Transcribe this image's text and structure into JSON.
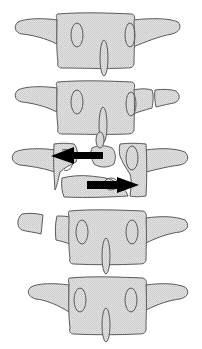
{
  "diagram": {
    "colors": {
      "bone_fill": "#d9d9d9",
      "outline": "#5a5a5a",
      "arrow": "#000000",
      "background": "#ffffff"
    },
    "vertebrae": [
      {
        "id": "v1",
        "label": "Intact vertebra (top)",
        "state": "intact"
      },
      {
        "id": "v2",
        "label": "Vertebra with fractured right transverse process",
        "state": "transverse-process-fracture"
      },
      {
        "id": "v3",
        "label": "Fracture-dislocation with displaced fragments",
        "state": "fracture-dislocation"
      },
      {
        "id": "v4",
        "label": "Vertebra with fractured left transverse process",
        "state": "transverse-process-fracture"
      },
      {
        "id": "v5",
        "label": "Intact vertebra (bottom)",
        "state": "intact"
      }
    ],
    "arrows": [
      {
        "id": "arrow-left",
        "direction": "left",
        "meaning": "Upper fragment displaced to the left"
      },
      {
        "id": "arrow-right",
        "direction": "right",
        "meaning": "Lower fragment displaced to the right"
      }
    ]
  }
}
